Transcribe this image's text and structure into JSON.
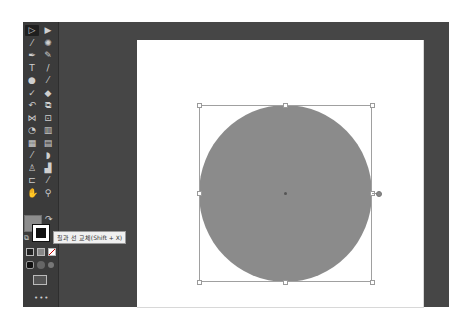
{
  "toolbar": {
    "tools": [
      {
        "name": "selection-tool",
        "glyph": "▷",
        "active": true
      },
      {
        "name": "direct-selection-tool",
        "glyph": "▶"
      },
      {
        "name": "magic-wand-tool",
        "glyph": "⁄"
      },
      {
        "name": "lasso-tool",
        "glyph": "✺"
      },
      {
        "name": "pen-tool",
        "glyph": "✒"
      },
      {
        "name": "curvature-tool",
        "glyph": "✎"
      },
      {
        "name": "type-tool",
        "glyph": "T"
      },
      {
        "name": "line-segment-tool",
        "glyph": "/"
      },
      {
        "name": "ellipse-tool",
        "glyph": "●"
      },
      {
        "name": "paintbrush-tool",
        "glyph": "⁄"
      },
      {
        "name": "shaper-tool",
        "glyph": "✓"
      },
      {
        "name": "eraser-tool",
        "glyph": "◆"
      },
      {
        "name": "rotate-tool",
        "glyph": "↶"
      },
      {
        "name": "scale-tool",
        "glyph": "⧉"
      },
      {
        "name": "width-tool",
        "glyph": "⋈"
      },
      {
        "name": "free-transform-tool",
        "glyph": "⊡"
      },
      {
        "name": "shape-builder-tool",
        "glyph": "◔"
      },
      {
        "name": "perspective-grid-tool",
        "glyph": "▥"
      },
      {
        "name": "mesh-tool",
        "glyph": "▦"
      },
      {
        "name": "gradient-tool",
        "glyph": "▤"
      },
      {
        "name": "eyedropper-tool",
        "glyph": "⁄"
      },
      {
        "name": "blend-tool",
        "glyph": "◗"
      },
      {
        "name": "symbol-sprayer-tool",
        "glyph": "♙"
      },
      {
        "name": "column-graph-tool",
        "glyph": "▟"
      },
      {
        "name": "artboard-tool",
        "glyph": "⊏"
      },
      {
        "name": "slice-tool",
        "glyph": "⁄"
      },
      {
        "name": "hand-tool",
        "glyph": "✋"
      },
      {
        "name": "zoom-tool",
        "glyph": "⚲"
      }
    ],
    "fill_color": "#8d8d8d",
    "stroke_color": "#111111",
    "swap_glyph": "↷",
    "default_glyph": "⧉",
    "mode_buttons": [
      "▣",
      "▥",
      "◪"
    ],
    "draw_mode_buttons": [
      "◐",
      "◑",
      "◒"
    ],
    "screen_mode_glyph": "⧉",
    "more_label": "•••"
  },
  "tooltip": {
    "text": "칠과 선 교체(Shift + X)"
  },
  "canvas": {
    "shape": "ellipse",
    "shape_fill": "#8b8b8b",
    "artboard_color": "#ffffff",
    "workspace_color": "#464646"
  }
}
